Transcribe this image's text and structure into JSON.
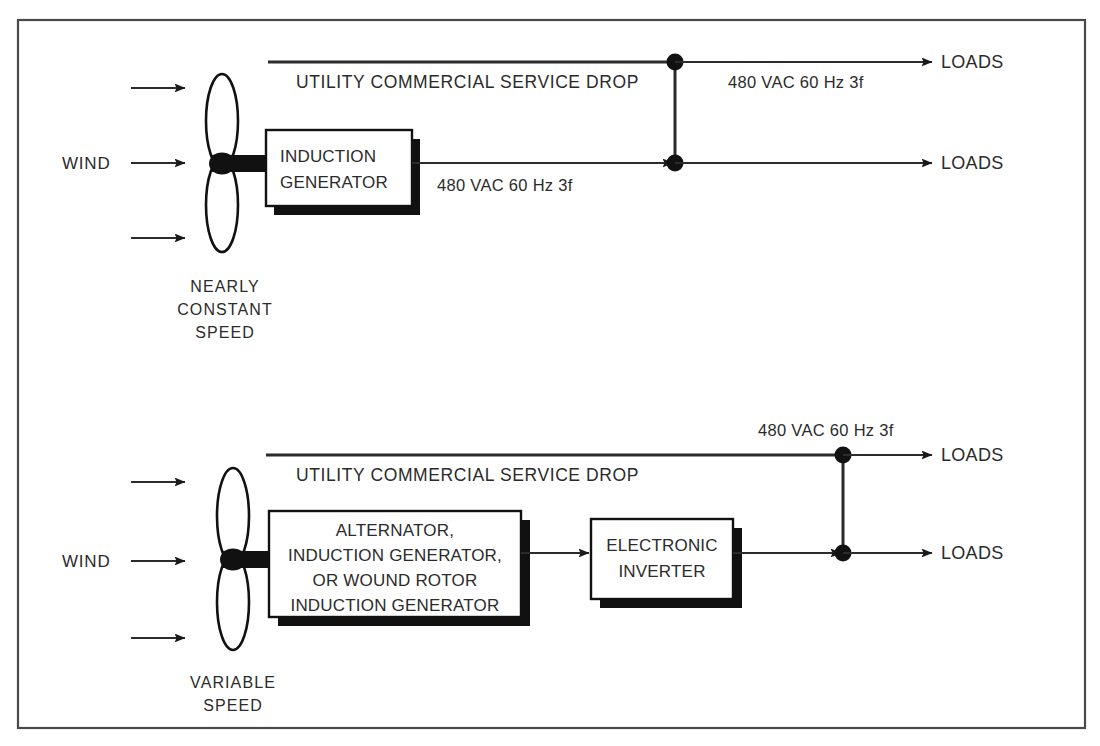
{
  "figure": {
    "background_color": "#ffffff",
    "line_color": "#2b2b2b",
    "frame_color": "#4a4a4a"
  },
  "top_system": {
    "name": "Nearly constant speed system",
    "wind_label": "WIND",
    "turbine_caption_line1": "NEARLY",
    "turbine_caption_line2": "CONSTANT",
    "turbine_caption_line3": "SPEED",
    "generator_box_line1": "INDUCTION",
    "generator_box_line2": "GENERATOR",
    "utility_line_label": "UTILITY  COMMERCIAL  SERVICE  DROP",
    "generator_output_label": "480 VAC  60 Hz 3f",
    "utility_output_label": "480 VAC  60 Hz 3f",
    "load_label_upper": "LOADS",
    "load_label_lower": "LOADS"
  },
  "bottom_system": {
    "name": "Variable speed system",
    "wind_label": "WIND",
    "turbine_caption_line1": "VARIABLE",
    "turbine_caption_line2": "SPEED",
    "generator_box_line1": "ALTERNATOR,",
    "generator_box_line2": "INDUCTION GENERATOR,",
    "generator_box_line3": "OR WOUND ROTOR",
    "generator_box_line4": "INDUCTION GENERATOR",
    "inverter_box_line1": "ELECTRONIC",
    "inverter_box_line2": "INVERTER",
    "utility_line_label": "UTILITY  COMMERCIAL  SERVICE  DROP",
    "utility_output_label": "480 VAC  60 Hz 3f",
    "load_label_upper": "LOADS",
    "load_label_lower": "LOADS"
  }
}
